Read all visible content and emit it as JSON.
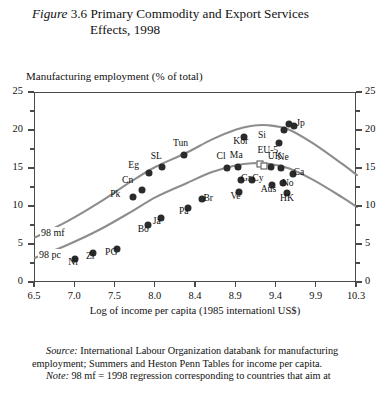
{
  "figure": {
    "number_prefix": "Figure",
    "number": "3.6",
    "title_line1": "Primary Commodity and Export Services",
    "title_line2": "Effects, 1998"
  },
  "axes": {
    "y_caption": "Manufacturing employment (% of total)",
    "x_caption": "Log of income per capita (1985 internationl US$)",
    "y_ticks": [
      "0",
      "5",
      "10",
      "15",
      "20",
      "25"
    ],
    "y_ticks_right": [
      "0",
      "5",
      "10",
      "15",
      "20",
      "25"
    ],
    "x_ticks": [
      "6.5",
      "7.0",
      "7.5",
      "8.0",
      "8.4",
      "8.9",
      "9.4",
      "9.9",
      "10.3"
    ]
  },
  "curves": {
    "mf_label": "98 mf",
    "pc_label": "98 pc"
  },
  "footer": {
    "source_word": "Source:",
    "source_text": " International Labour Organization databank for manufacturing",
    "source_text2": "employment; Summers and Heston Penn Tables for income per capita.",
    "note_word": "Note:",
    "note_text": "  98 mf = 1998 regression corresponding to countries that aim at"
  },
  "chart_data": {
    "type": "scatter",
    "title": "Figure 3.6 Primary Commodity and Export Services Effects, 1998",
    "xlabel": "Log of income per capita (1985 internationl US$)",
    "ylabel": "Manufacturing employment (% of total)",
    "xlim": [
      6.5,
      10.3
    ],
    "ylim": [
      0,
      25
    ],
    "grid": false,
    "legend": "none",
    "x_tick_values": [
      6.5,
      7.0,
      7.5,
      8.0,
      8.4,
      8.9,
      9.4,
      9.9,
      10.3
    ],
    "y_tick_values": [
      0,
      5,
      10,
      15,
      20,
      25
    ],
    "points": [
      {
        "label": "Ni",
        "x": 7.0,
        "y": 3.1,
        "label_dx": -2,
        "label_dy": 9,
        "marker": "filled"
      },
      {
        "label": "Zi",
        "x": 7.22,
        "y": 3.9,
        "label_dx": -2,
        "label_dy": 9,
        "marker": "filled"
      },
      {
        "label": "PG",
        "x": 7.52,
        "y": 4.5,
        "label_dx": -7,
        "label_dy": 9,
        "marker": "filled"
      },
      {
        "label": "Pk",
        "x": 7.72,
        "y": 11.3,
        "label_dx": -18,
        "label_dy": 3,
        "marker": "filled"
      },
      {
        "label": "Cn",
        "x": 7.83,
        "y": 12.2,
        "label_dx": -15,
        "label_dy": -4,
        "marker": "filled"
      },
      {
        "label": "Eg",
        "x": 7.92,
        "y": 14.5,
        "label_dx": -16,
        "label_dy": -2,
        "marker": "filled"
      },
      {
        "label": "Bo",
        "x": 7.9,
        "y": 7.6,
        "label_dx": -5,
        "label_dy": 10,
        "marker": "filled"
      },
      {
        "label": "Ja",
        "x": 8.05,
        "y": 8.6,
        "label_dx": -3,
        "label_dy": 9,
        "marker": "filled"
      },
      {
        "label": "SL",
        "x": 8.06,
        "y": 15.3,
        "label_dx": -6,
        "label_dy": -5,
        "marker": "filled"
      },
      {
        "label": "Tun",
        "x": 8.28,
        "y": 16.8,
        "label_dx": -6,
        "label_dy": -6,
        "marker": "filled"
      },
      {
        "label": "Pa",
        "x": 8.32,
        "y": 9.9,
        "label_dx": -4,
        "label_dy": 9,
        "marker": "filled"
      },
      {
        "label": "Br",
        "x": 8.48,
        "y": 11.0,
        "label_dx": 6,
        "label_dy": 5,
        "marker": "filled"
      },
      {
        "label": "Cl",
        "x": 8.78,
        "y": 15.1,
        "label_dx": -5,
        "label_dy": -6,
        "marker": "filled"
      },
      {
        "label": "Ma",
        "x": 8.92,
        "y": 15.3,
        "label_dx": -3,
        "label_dy": -6,
        "marker": "filled"
      },
      {
        "label": "Kor",
        "x": 9.0,
        "y": 19.2,
        "label_dx": -6,
        "label_dy": 10,
        "marker": "filled"
      },
      {
        "label": "Gr",
        "x": 8.96,
        "y": 13.5,
        "label_dx": 5,
        "label_dy": 4,
        "marker": "filled"
      },
      {
        "label": "Ve",
        "x": 8.94,
        "y": 12.0,
        "label_dx": -4,
        "label_dy": 10,
        "marker": "filled"
      },
      {
        "label": "Cy",
        "x": 9.1,
        "y": 13.6,
        "label_dx": 5,
        "label_dy": 4,
        "marker": "filled"
      },
      {
        "label": "EU-5",
        "x": 9.2,
        "y": 15.6,
        "label_dx": 2,
        "label_dy": -8,
        "marker": "open"
      },
      {
        "label": "Si",
        "x": 9.43,
        "y": 18.4,
        "label_dx": -16,
        "label_dy": -2,
        "marker": "filled"
      },
      {
        "label": "Jp",
        "x": 9.62,
        "y": 20.6,
        "label_dx": 7,
        "label_dy": 3,
        "marker": "filled"
      },
      {
        "label": "Jp2",
        "x": 9.55,
        "y": 20.9,
        "label_dx": 0,
        "label_dy": 0,
        "marker": "filled",
        "hide_label": true
      },
      {
        "label": "Jp3",
        "x": 9.49,
        "y": 20.1,
        "label_dx": 0,
        "label_dy": 0,
        "marker": "filled",
        "hide_label": true
      },
      {
        "label": "UK",
        "x": 9.33,
        "y": 15.2,
        "label_dx": 2,
        "label_dy": -5,
        "marker": "filled"
      },
      {
        "label": "EU5b",
        "x": 9.24,
        "y": 15.4,
        "label_dx": 0,
        "label_dy": 0,
        "marker": "open",
        "hide_label": true
      },
      {
        "label": "Ne",
        "x": 9.45,
        "y": 15.1,
        "label_dx": 2,
        "label_dy": -5,
        "marker": "filled"
      },
      {
        "label": "Ca",
        "x": 9.6,
        "y": 14.4,
        "label_dx": 6,
        "label_dy": 4,
        "marker": "filled"
      },
      {
        "label": "No",
        "x": 9.48,
        "y": 13.2,
        "label_dx": 4,
        "label_dy": 6,
        "marker": "filled"
      },
      {
        "label": "Aus",
        "x": 9.34,
        "y": 12.9,
        "label_dx": -6,
        "label_dy": 10,
        "marker": "filled"
      },
      {
        "label": "HK",
        "x": 9.53,
        "y": 11.9,
        "label_dx": -2,
        "label_dy": 11,
        "marker": "filled"
      }
    ],
    "curve_mf": {
      "name": "98 mf",
      "x": [
        6.5,
        6.9,
        7.3,
        7.7,
        8.0,
        8.3,
        8.6,
        8.9,
        9.1,
        9.3,
        9.55,
        9.85,
        10.15,
        10.3
      ],
      "y": [
        6.0,
        8.1,
        10.6,
        13.4,
        15.3,
        17.1,
        18.9,
        20.2,
        20.7,
        20.75,
        20.2,
        18.4,
        15.7,
        14.2
      ]
    },
    "curve_pc": {
      "name": "98 pc",
      "x": [
        6.5,
        6.9,
        7.3,
        7.7,
        8.0,
        8.3,
        8.6,
        8.9,
        9.1,
        9.3,
        9.55,
        9.85,
        10.15,
        10.3
      ],
      "y": [
        3.3,
        5.0,
        7.0,
        9.4,
        11.3,
        13.1,
        14.6,
        15.5,
        15.75,
        15.7,
        15.1,
        13.6,
        11.3,
        10.0
      ]
    }
  }
}
